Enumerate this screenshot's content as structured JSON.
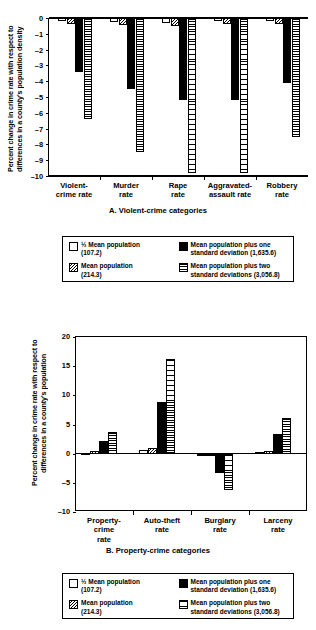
{
  "chart_data": [
    {
      "type": "bar",
      "panel": "A",
      "title": "A. Violent-crime categories",
      "xlabel": "",
      "ylabel": "Percent change in crime rate with respect to differences in a county's population density",
      "ylim": [
        -10,
        0
      ],
      "yticks": [
        "0",
        "–1",
        "–2",
        "–3",
        "–4",
        "–5",
        "–6",
        "–7",
        "–8",
        "–9",
        "–10"
      ],
      "grid": false,
      "legend_position": "below",
      "categories": [
        "Violent-\ncrime rate",
        "Murder\nrate",
        "Rape\nrate",
        "Aggravated-\nassault rate",
        "Robbery\nrate"
      ],
      "series": [
        {
          "name": "½ Mean population (107.2)",
          "pattern": "white",
          "values": [
            -0.2,
            -0.25,
            -0.3,
            -0.2,
            -0.2
          ]
        },
        {
          "name": "Mean population (214.3)",
          "pattern": "hatch",
          "values": [
            -0.35,
            -0.45,
            -0.5,
            -0.4,
            -0.4
          ]
        },
        {
          "name": "Mean population plus one standard deviation (1,635.6)",
          "pattern": "black",
          "values": [
            -3.4,
            -4.5,
            -5.2,
            -5.2,
            -4.1
          ]
        },
        {
          "name": "Mean population plus two standard deviations (3,056.8)",
          "pattern": "hline",
          "values": [
            -6.4,
            -8.5,
            -9.8,
            -9.8,
            -7.5
          ]
        }
      ]
    },
    {
      "type": "bar",
      "panel": "B",
      "title": "B. Property-crime categories",
      "xlabel": "",
      "ylabel": "Percent change in crime rate with respect to differences in a county's population",
      "ylim": [
        -10,
        20
      ],
      "yticks": [
        "20",
        "15",
        "10",
        "5",
        "0",
        "–5",
        "–10"
      ],
      "grid": false,
      "legend_position": "below",
      "categories": [
        "Property-\ncrime\nrate",
        "Auto-theft\nrate",
        "Burglary\nrate",
        "Larceny\nrate"
      ],
      "series": [
        {
          "name": "½ Mean population (107.2)",
          "pattern": "white",
          "values": [
            0.2,
            0.6,
            -0.1,
            0.3
          ]
        },
        {
          "name": "Mean population (214.3)",
          "pattern": "hatch",
          "values": [
            0.4,
            1.0,
            -0.2,
            0.4
          ]
        },
        {
          "name": "Mean population plus one standard deviation (1,635.6)",
          "pattern": "black",
          "values": [
            2.2,
            8.9,
            -3.3,
            3.3
          ]
        },
        {
          "name": "Mean population plus two standard deviations (3,056.8)",
          "pattern": "hline",
          "values": [
            3.7,
            16.3,
            -6.2,
            6.2
          ]
        }
      ]
    }
  ],
  "legend": {
    "items": [
      {
        "pattern": "white",
        "label": "½ Mean population\n(107.2)"
      },
      {
        "pattern": "hatch",
        "label": "Mean population\n(214.3)"
      },
      {
        "pattern": "black",
        "label": "Mean population plus one\n   standard deviation (1,635.6)"
      },
      {
        "pattern": "hline",
        "label": "Mean population plus two\n   standard deviations (3,056.8)"
      }
    ]
  }
}
